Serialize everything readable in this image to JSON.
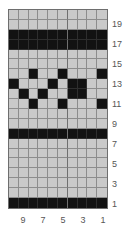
{
  "chart_data": {
    "type": "heatmap",
    "title": "",
    "subtitle": "",
    "xlabel": "",
    "ylabel": "",
    "legend": [],
    "grid": true,
    "columns": 10,
    "rows": 20,
    "colors": {
      "filled": "#121212",
      "empty": "#c9c9c9",
      "gridline": "#8c8c8c",
      "border": "#6e6e6e",
      "label_text": "#565656",
      "background": "#ffffff"
    },
    "row_tick_labels": [
      "19",
      "17",
      "15",
      "13",
      "11",
      "9",
      "7",
      "5",
      "3",
      "1"
    ],
    "row_tick_rows": [
      19,
      17,
      15,
      13,
      11,
      9,
      7,
      5,
      3,
      1
    ],
    "column_tick_labels": [
      "9",
      "7",
      "5",
      "3",
      "1"
    ],
    "column_tick_columns": [
      9,
      7,
      5,
      3,
      1
    ],
    "row_order": "bottom-to-top",
    "column_order": "right-to-left",
    "cells": [
      {
        "row": 20,
        "filled_columns": []
      },
      {
        "row": 19,
        "filled_columns": []
      },
      {
        "row": 18,
        "filled_columns": [
          1,
          2,
          3,
          4,
          5,
          6,
          7,
          8,
          9,
          10
        ]
      },
      {
        "row": 17,
        "filled_columns": [
          1,
          2,
          3,
          4,
          5,
          6,
          7,
          8,
          9,
          10
        ]
      },
      {
        "row": 16,
        "filled_columns": []
      },
      {
        "row": 15,
        "filled_columns": []
      },
      {
        "row": 14,
        "filled_columns": [
          3,
          6,
          10
        ]
      },
      {
        "row": 13,
        "filled_columns": [
          1,
          5,
          7,
          8
        ]
      },
      {
        "row": 12,
        "filled_columns": [
          2,
          4,
          7,
          8
        ]
      },
      {
        "row": 11,
        "filled_columns": [
          3,
          6,
          10
        ]
      },
      {
        "row": 10,
        "filled_columns": []
      },
      {
        "row": 9,
        "filled_columns": []
      },
      {
        "row": 8,
        "filled_columns": [
          1,
          2,
          3,
          4,
          5,
          6,
          7,
          8,
          9,
          10
        ]
      },
      {
        "row": 7,
        "filled_columns": []
      },
      {
        "row": 6,
        "filled_columns": []
      },
      {
        "row": 5,
        "filled_columns": []
      },
      {
        "row": 4,
        "filled_columns": []
      },
      {
        "row": 3,
        "filled_columns": []
      },
      {
        "row": 2,
        "filled_columns": []
      },
      {
        "row": 1,
        "filled_columns": [
          1,
          2,
          3,
          4,
          5,
          6,
          7,
          8,
          9,
          10
        ]
      }
    ],
    "matrix_top_to_bottom": [
      [
        0,
        0,
        0,
        0,
        0,
        0,
        0,
        0,
        0,
        0
      ],
      [
        0,
        0,
        0,
        0,
        0,
        0,
        0,
        0,
        0,
        0
      ],
      [
        1,
        1,
        1,
        1,
        1,
        1,
        1,
        1,
        1,
        1
      ],
      [
        1,
        1,
        1,
        1,
        1,
        1,
        1,
        1,
        1,
        1
      ],
      [
        0,
        0,
        0,
        0,
        0,
        0,
        0,
        0,
        0,
        0
      ],
      [
        0,
        0,
        0,
        0,
        0,
        0,
        0,
        0,
        0,
        0
      ],
      [
        0,
        0,
        1,
        0,
        0,
        1,
        0,
        0,
        0,
        1
      ],
      [
        1,
        0,
        0,
        0,
        1,
        0,
        1,
        1,
        0,
        0
      ],
      [
        0,
        1,
        0,
        1,
        0,
        0,
        1,
        1,
        0,
        0
      ],
      [
        0,
        0,
        1,
        0,
        0,
        1,
        0,
        0,
        0,
        1
      ],
      [
        0,
        0,
        0,
        0,
        0,
        0,
        0,
        0,
        0,
        0
      ],
      [
        0,
        0,
        0,
        0,
        0,
        0,
        0,
        0,
        0,
        0
      ],
      [
        1,
        1,
        1,
        1,
        1,
        1,
        1,
        1,
        1,
        1
      ],
      [
        0,
        0,
        0,
        0,
        0,
        0,
        0,
        0,
        0,
        0
      ],
      [
        0,
        0,
        0,
        0,
        0,
        0,
        0,
        0,
        0,
        0
      ],
      [
        0,
        0,
        0,
        0,
        0,
        0,
        0,
        0,
        0,
        0
      ],
      [
        0,
        0,
        0,
        0,
        0,
        0,
        0,
        0,
        0,
        0
      ],
      [
        0,
        0,
        0,
        0,
        0,
        0,
        0,
        0,
        0,
        0
      ],
      [
        0,
        0,
        0,
        0,
        0,
        0,
        0,
        0,
        0,
        0
      ],
      [
        1,
        1,
        1,
        1,
        1,
        1,
        1,
        1,
        1,
        1
      ]
    ]
  }
}
